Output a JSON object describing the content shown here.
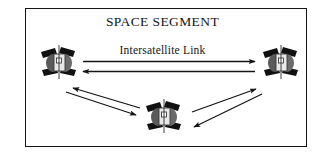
{
  "diagram": {
    "title": "SPACE SEGMENT",
    "link_label": "Intersatellite Link",
    "border_color": "#141414",
    "background_color": "#ffffff",
    "arrow_color": "#141414",
    "satellites": [
      {
        "id": "satellite-left",
        "name": "satellite",
        "x": 39,
        "y": 43
      },
      {
        "id": "satellite-right",
        "name": "satellite",
        "x": 261,
        "y": 43
      },
      {
        "id": "satellite-center",
        "name": "satellite",
        "x": 144,
        "y": 97
      }
    ],
    "links": [
      {
        "id": "link-left-to-right",
        "direction": "right",
        "from": "satellite-left",
        "to": "satellite-right"
      },
      {
        "id": "link-right-to-left",
        "direction": "left",
        "from": "satellite-right",
        "to": "satellite-left"
      },
      {
        "id": "link-center-to-left-up",
        "direction": "up-left",
        "from": "satellite-center",
        "to": "satellite-left"
      },
      {
        "id": "link-left-to-center-down",
        "direction": "down-right",
        "from": "satellite-left",
        "to": "satellite-center"
      },
      {
        "id": "link-center-to-right-up",
        "direction": "up-right",
        "from": "satellite-center",
        "to": "satellite-right"
      },
      {
        "id": "link-right-to-center-down",
        "direction": "down-left",
        "from": "satellite-right",
        "to": "satellite-center"
      }
    ]
  }
}
